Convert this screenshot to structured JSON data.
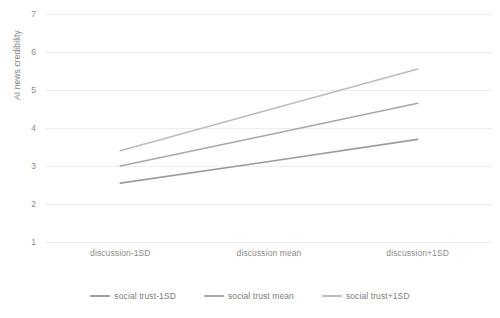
{
  "chart_data": {
    "type": "line",
    "title": "",
    "xlabel": "",
    "ylabel": "AI news credibility",
    "categories": [
      "discussion-1SD",
      "discussion mean",
      "discussion+1SD"
    ],
    "ylim": [
      1,
      7
    ],
    "yticks": [
      1,
      2,
      3,
      4,
      5,
      6,
      7
    ],
    "grid": true,
    "legend_position": "bottom",
    "series": [
      {
        "name": "social trust-1SD",
        "color": "#9c9c9c",
        "values": [
          2.55,
          3.12,
          3.7
        ]
      },
      {
        "name": "social trust mean",
        "color": "#a8a8a8",
        "values": [
          3.0,
          3.82,
          4.65
        ]
      },
      {
        "name": "social trust+1SD",
        "color": "#bcbcbc",
        "values": [
          3.4,
          4.48,
          5.55
        ]
      }
    ]
  },
  "axes": {
    "y_title": "AI news credibility",
    "y_tick_labels": [
      "7",
      "6",
      "5",
      "4",
      "3",
      "2",
      "1"
    ],
    "x_tick_labels": [
      "discussion-1SD",
      "discussion mean",
      "discussion+1SD"
    ]
  },
  "legend": {
    "items": [
      {
        "label": "social trust-1SD",
        "color": "#9c9c9c"
      },
      {
        "label": "social trust mean",
        "color": "#a8a8a8"
      },
      {
        "label": "social trust+1SD",
        "color": "#bcbcbc"
      }
    ]
  },
  "style": {
    "gridline_color": "#ededee",
    "text_color": "#8a8a8a",
    "background": "#ffffff"
  }
}
